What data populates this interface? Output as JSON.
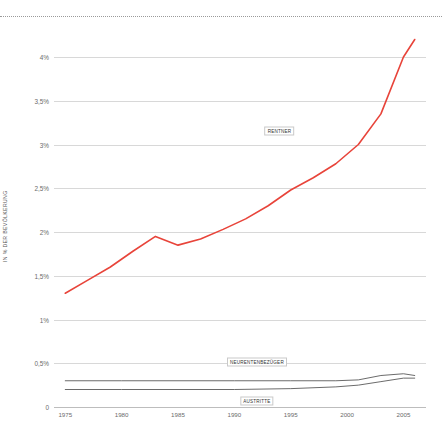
{
  "chart_data": {
    "type": "line",
    "title": "",
    "xlabel": "",
    "ylabel": "IN % DER BEVÖLKERUNG",
    "xlim": [
      1974,
      2007
    ],
    "ylim": [
      0,
      4.4
    ],
    "grid": true,
    "legend_position": "inline-labels",
    "x_ticks": [
      "1975",
      "1980",
      "1985",
      "1990",
      "1995",
      "2000",
      "2005"
    ],
    "x_tick_values": [
      1975,
      1980,
      1985,
      1990,
      1995,
      2000,
      2005
    ],
    "y_ticks": [
      "0",
      "0,5%",
      "1%",
      "1,5%",
      "2%",
      "2,5%",
      "3%",
      "3,5%",
      "4%"
    ],
    "y_tick_values": [
      0,
      0.5,
      1,
      1.5,
      2,
      2.5,
      3,
      3.5,
      4
    ],
    "series": [
      {
        "name": "RENTNER",
        "color": "#e8443a",
        "label_x": 1994,
        "label_y": 3.15,
        "x": [
          1975,
          1977,
          1979,
          1981,
          1983,
          1985,
          1987,
          1989,
          1991,
          1993,
          1995,
          1997,
          1999,
          2001,
          2003,
          2005,
          2006
        ],
        "y": [
          1.3,
          1.45,
          1.6,
          1.78,
          1.95,
          1.85,
          1.92,
          2.03,
          2.15,
          2.3,
          2.48,
          2.62,
          2.78,
          3.0,
          3.35,
          4.0,
          4.2
        ]
      },
      {
        "name": "NEURENTENBEZÜGER",
        "color": "#5a5a5a",
        "label_x": 1992,
        "label_y": 0.52,
        "x": [
          1975,
          1980,
          1985,
          1990,
          1995,
          1999,
          2001,
          2003,
          2005,
          2006
        ],
        "y": [
          0.3,
          0.3,
          0.3,
          0.3,
          0.3,
          0.3,
          0.31,
          0.36,
          0.38,
          0.36
        ]
      },
      {
        "name": "AUSTRITTE",
        "color": "#5a5a5a",
        "label_x": 1992,
        "label_y": 0.07,
        "x": [
          1975,
          1980,
          1985,
          1990,
          1995,
          1999,
          2001,
          2003,
          2005,
          2006
        ],
        "y": [
          0.2,
          0.2,
          0.2,
          0.2,
          0.21,
          0.23,
          0.25,
          0.29,
          0.33,
          0.33
        ]
      }
    ]
  }
}
